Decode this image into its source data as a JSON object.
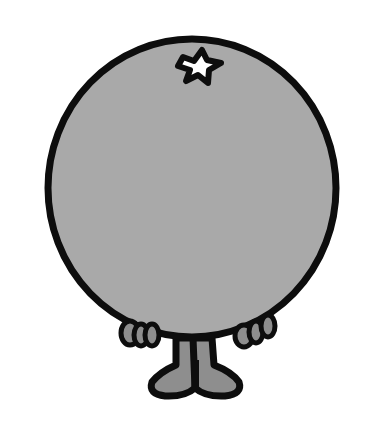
{
  "illustration": {
    "subject": "Round gray cartoon character with star mark, hands and feet",
    "colors": {
      "background": "#ffffff",
      "body_fill": "#a9a9a9",
      "outline": "#0d0d0d",
      "limb_fill": "#8e8e8e",
      "star_fill": "#ffffff"
    },
    "parts": [
      "body",
      "star-mark",
      "left-hand",
      "right-hand",
      "legs",
      "left-foot",
      "right-foot"
    ]
  }
}
